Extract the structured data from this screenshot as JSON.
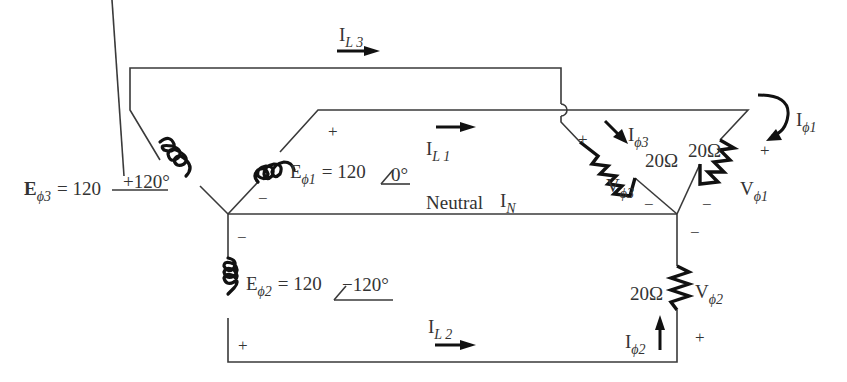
{
  "diagram": {
    "sources": [
      {
        "id": "E_phi1",
        "symbol": "E",
        "subscript": "ϕ1",
        "equation": "= 120",
        "angle": "0°",
        "plus": "+",
        "minus": "−"
      },
      {
        "id": "E_phi2",
        "symbol": "E",
        "subscript": "ϕ2",
        "equation": "= 120",
        "angle": "−120°",
        "plus": "+",
        "minus": "−"
      },
      {
        "id": "E_phi3",
        "symbol": "E",
        "subscript": "ϕ3",
        "equation": "= 120",
        "angle": "+120°"
      }
    ],
    "line_currents": [
      {
        "id": "I_L1",
        "symbol": "I",
        "subscript": "L 1",
        "direction": "right"
      },
      {
        "id": "I_L2",
        "symbol": "I",
        "subscript": "L 2",
        "direction": "right"
      },
      {
        "id": "I_L3",
        "symbol": "I",
        "subscript": "L 3",
        "direction": "right"
      }
    ],
    "neutral": {
      "label": "Neutral",
      "current_symbol": "I",
      "current_subscript": "N"
    },
    "loads": [
      {
        "id": "R_phi1",
        "resistance": "20Ω",
        "voltage_symbol": "V",
        "voltage_subscript": "ϕ1",
        "current_symbol": "I",
        "current_subscript": "ϕ1",
        "plus": "+",
        "minus": "−"
      },
      {
        "id": "R_phi2",
        "resistance": "20Ω",
        "voltage_symbol": "V",
        "voltage_subscript": "ϕ2",
        "current_symbol": "I",
        "current_subscript": "ϕ2",
        "plus": "+",
        "minus": "−"
      },
      {
        "id": "R_phi3",
        "resistance": "20Ω",
        "voltage_symbol": "V",
        "voltage_subscript": "ϕ3",
        "current_symbol": "I",
        "current_subscript": "ϕ3",
        "plus": "+",
        "minus": "−"
      }
    ],
    "colors": {
      "wire": "#3a3a3a",
      "component": "#111111",
      "text": "#333333",
      "background": "#ffffff"
    }
  }
}
